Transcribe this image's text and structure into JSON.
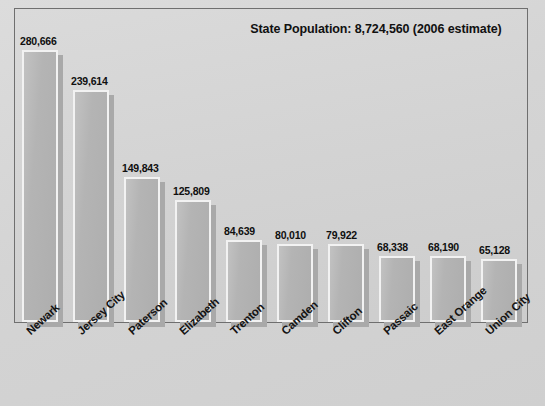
{
  "chart_data": {
    "type": "bar",
    "title": "State Population: 8,724,560 (2006 estimate)",
    "xlabel": "",
    "ylabel": "",
    "ylim": [
      0,
      300000
    ],
    "grid": false,
    "legend": "none",
    "orientation": "vertical",
    "value_labels_shown": true,
    "axis_tick_labels_rotated_deg": -42,
    "categories": [
      "Newark",
      "Jersey City",
      "Paterson",
      "Elizabeth",
      "Trenton",
      "Camden",
      "Clifton",
      "Passaic",
      "East Orange",
      "Union City"
    ],
    "values": [
      280666,
      239614,
      149843,
      125809,
      84639,
      80010,
      79922,
      68338,
      68190,
      65128
    ],
    "value_labels": [
      "280,666",
      "239,614",
      "149,843",
      "125,809",
      "84,639",
      "80,010",
      "79,922",
      "68,338",
      "68,190",
      "65,128"
    ]
  },
  "colors": {
    "page_background": "#d6d6d6",
    "plot_background": "#d4d4d4",
    "plot_border": "#6f6f6f",
    "bar_fill": "#b4b4b4",
    "bar_outline": "#f2f2f2",
    "bar_shadow": "#a9a9a9",
    "text": "#111111"
  }
}
